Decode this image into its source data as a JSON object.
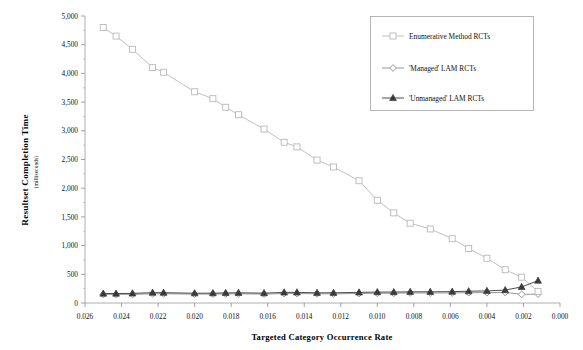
{
  "figure": {
    "top_artifact_text": "",
    "background_color": "#ffffff"
  },
  "chart_data": {
    "type": "line",
    "title": "",
    "xlabel": "Targeted Category Occurrence Rate",
    "ylabel": "Resultset Completion Time",
    "ylabel_units": "(milliseconds)",
    "xlim": [
      0.026,
      0.0
    ],
    "ylim": [
      0,
      5000
    ],
    "x_reversed": true,
    "grid": false,
    "legend_position": "top-right",
    "xticks": [
      0.026,
      0.024,
      0.022,
      0.02,
      0.018,
      0.016,
      0.014,
      0.012,
      0.01,
      0.008,
      0.006,
      0.004,
      0.002,
      0.0
    ],
    "xticklabels": [
      "0.026",
      "0.024",
      "0.022",
      "0.020",
      "0.018",
      "0.016",
      "0.014",
      "0.012",
      "0.010",
      "0.008",
      "0.006",
      "0.004",
      "0.002",
      "0.000"
    ],
    "yticks": [
      0,
      500,
      1000,
      1500,
      2000,
      2500,
      3000,
      3500,
      4000,
      4500,
      5000
    ],
    "yticklabels": [
      "0",
      "500",
      "1,000",
      "1,500",
      "2,000",
      "2,500",
      "3,000",
      "3,500",
      "4,000",
      "4,500",
      "5,000"
    ],
    "x": [
      0.025,
      0.0243,
      0.0234,
      0.0223,
      0.0217,
      0.02,
      0.019,
      0.0183,
      0.0176,
      0.0162,
      0.0151,
      0.0144,
      0.0133,
      0.0124,
      0.011,
      0.01,
      0.0091,
      0.0082,
      0.0071,
      0.0059,
      0.005,
      0.004,
      0.003,
      0.0021,
      0.0012
    ],
    "series": [
      {
        "name": "Enumerative Method RCTs",
        "marker": "open-square",
        "color": "#b9b9b9",
        "values": [
          4800,
          4650,
          4420,
          4100,
          4020,
          3680,
          3560,
          3410,
          3280,
          3030,
          2800,
          2720,
          2490,
          2370,
          2130,
          1790,
          1570,
          1390,
          1290,
          1120,
          950,
          780,
          580,
          450,
          200
        ]
      },
      {
        "name": "'Managed' LAM RCTs",
        "marker": "open-diamond",
        "color": "#8c8c8c",
        "values": [
          150,
          150,
          150,
          160,
          160,
          155,
          155,
          158,
          160,
          155,
          165,
          165,
          160,
          160,
          165,
          170,
          170,
          175,
          175,
          175,
          180,
          180,
          185,
          150,
          155
        ]
      },
      {
        "name": "'Unmanaged' LAM RCTs",
        "marker": "filled-triangle",
        "color": "#3a3a3a",
        "values": [
          165,
          165,
          168,
          180,
          180,
          170,
          172,
          175,
          178,
          172,
          185,
          185,
          178,
          178,
          185,
          190,
          190,
          195,
          195,
          198,
          205,
          210,
          225,
          280,
          390
        ]
      }
    ]
  }
}
